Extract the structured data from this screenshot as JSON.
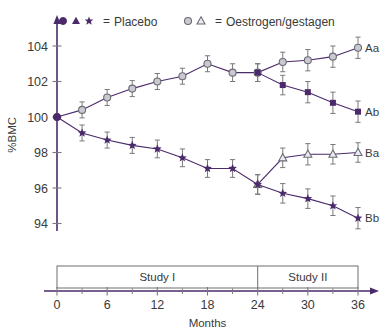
{
  "chart_data": {
    "type": "line",
    "title": "",
    "xlabel": "Months",
    "ylabel": "%BMC",
    "xlim": [
      0,
      36
    ],
    "ylim": [
      93.2,
      104.8
    ],
    "yticks": [
      94,
      96,
      98,
      100,
      102,
      104
    ],
    "xticks_labeled": [
      0,
      6,
      12,
      18,
      24,
      30,
      36
    ],
    "xticks_minor": [
      3,
      9,
      15,
      21,
      27,
      33
    ],
    "grid": false,
    "legend_position": "top",
    "error_bars": true,
    "accent_color": "#4b2a6b",
    "open_marker_color": "#c9c9cf",
    "axis_color": "#7a7a7a",
    "legend": [
      {
        "markers": [
          "filled-circle",
          "filled-triangle",
          "filled-star"
        ],
        "equals": "=",
        "label": "Placebo"
      },
      {
        "markers": [
          "open-circle",
          "open-triangle"
        ],
        "equals": "=",
        "label": "Oestrogen/gestagen"
      }
    ],
    "study_bands": [
      {
        "label": "Study I",
        "from": 0,
        "to": 24
      },
      {
        "label": "Study II",
        "from": 24,
        "to": 36
      }
    ],
    "series": [
      {
        "name": "Aa",
        "label": "Aa",
        "group": "Oestrogen/gestagen",
        "marker": "open-circle",
        "x": [
          0,
          3,
          6,
          9,
          12,
          15,
          18,
          21,
          24,
          27,
          30,
          33,
          36
        ],
        "values": [
          100.0,
          100.4,
          101.1,
          101.6,
          102.0,
          102.3,
          103.0,
          102.5,
          102.5,
          103.1,
          103.2,
          103.4,
          103.9
        ],
        "errors": [
          0.0,
          0.45,
          0.45,
          0.45,
          0.45,
          0.45,
          0.45,
          0.5,
          0.5,
          0.55,
          0.6,
          0.6,
          0.6
        ]
      },
      {
        "name": "Ab",
        "label": "Ab",
        "group": "Placebo",
        "marker": "filled-square",
        "x": [
          24,
          27,
          30,
          33,
          36
        ],
        "values": [
          102.5,
          101.8,
          101.4,
          100.8,
          100.3
        ],
        "errors": [
          0.5,
          0.55,
          0.6,
          0.6,
          0.6
        ]
      },
      {
        "name": "Ba",
        "label": "Ba",
        "group": "Oestrogen/gestagen",
        "marker": "open-triangle",
        "x": [
          24,
          27,
          30,
          33,
          36
        ],
        "values": [
          96.2,
          97.7,
          97.9,
          97.9,
          98.0
        ],
        "errors": [
          0.55,
          0.55,
          0.6,
          0.55,
          0.55
        ]
      },
      {
        "name": "Bb",
        "label": "Bb",
        "group": "Placebo",
        "marker": "filled-star",
        "x": [
          0,
          3,
          6,
          9,
          12,
          15,
          18,
          21,
          24,
          27,
          30,
          33,
          36
        ],
        "values": [
          100.0,
          99.1,
          98.7,
          98.4,
          98.2,
          97.7,
          97.1,
          97.1,
          96.2,
          95.7,
          95.4,
          95.0,
          94.3
        ],
        "errors": [
          0.0,
          0.45,
          0.45,
          0.45,
          0.5,
          0.5,
          0.5,
          0.5,
          0.55,
          0.55,
          0.55,
          0.55,
          0.6
        ]
      }
    ]
  }
}
